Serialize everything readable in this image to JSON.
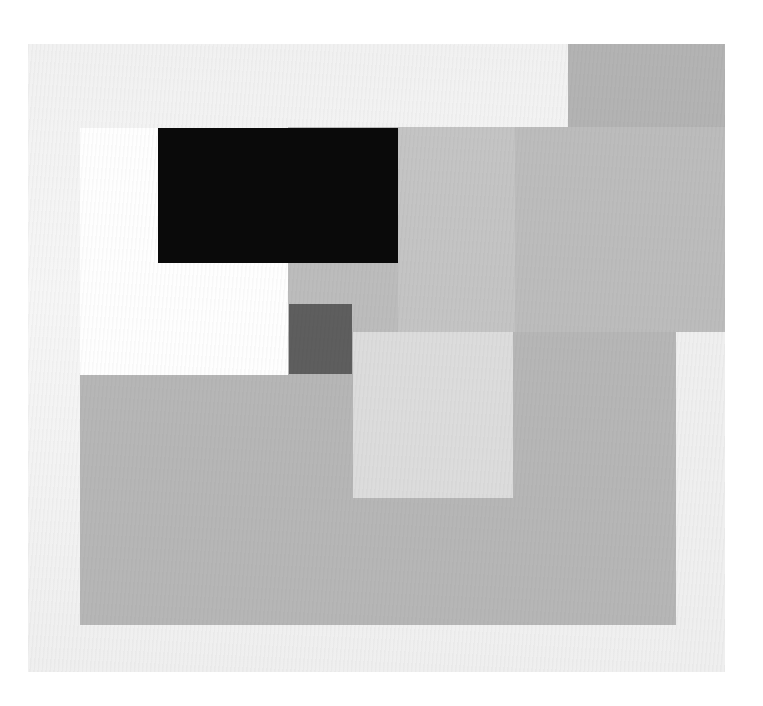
{
  "artwork": {
    "description": "Abstract geometric composition of overlapping grey, black and white rectangles on a light canvas",
    "colors": {
      "page_bg": "#ffffff",
      "canvas_bg": "#f3f3f3",
      "top_right_gray": "#b3b3b3",
      "mid_gray": "#bcbcbc",
      "mid_gray_band": "#c4c4c4",
      "white_block": "#fefefe",
      "black_block": "#0a0a0a",
      "dark_square": "#5e5e5e",
      "light_square": "#dcdcdc",
      "lower_gray": "#b6b6b6",
      "right_light_strip": "#efefef"
    },
    "shapes": [
      {
        "name": "canvas",
        "x": 28,
        "y": 44,
        "w": 697,
        "h": 628
      },
      {
        "name": "top-right-gray-block",
        "x": 568,
        "y": 44,
        "w": 157,
        "h": 288
      },
      {
        "name": "middle-gray-field",
        "x": 288,
        "y": 127,
        "w": 437,
        "h": 205
      },
      {
        "name": "middle-gray-band",
        "x": 398,
        "y": 127,
        "w": 117,
        "h": 205
      },
      {
        "name": "white-block",
        "x": 80,
        "y": 128,
        "w": 208,
        "h": 247
      },
      {
        "name": "black-rectangle",
        "x": 158,
        "y": 128,
        "w": 240,
        "h": 135
      },
      {
        "name": "lower-gray-field",
        "x": 80,
        "y": 332,
        "w": 596,
        "h": 293
      },
      {
        "name": "dark-square",
        "x": 289,
        "y": 304,
        "w": 63,
        "h": 70
      },
      {
        "name": "light-square",
        "x": 353,
        "y": 332,
        "w": 160,
        "h": 166
      },
      {
        "name": "right-light-strip",
        "x": 676,
        "y": 332,
        "w": 49,
        "h": 340
      }
    ]
  }
}
